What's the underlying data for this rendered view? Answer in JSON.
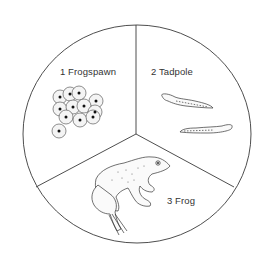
{
  "diagram": {
    "stages": [
      {
        "number": "1",
        "label": "1 Frogspawn",
        "icon": "frogspawn-icon"
      },
      {
        "number": "2",
        "label": "2 Tadpole",
        "icon": "tadpole-icon"
      },
      {
        "number": "3",
        "label": "3 Frog",
        "icon": "frog-icon"
      }
    ],
    "colors": {
      "line": "#3a3a3a",
      "background": "#ffffff",
      "egg_fill": "#f4f4f4"
    }
  }
}
